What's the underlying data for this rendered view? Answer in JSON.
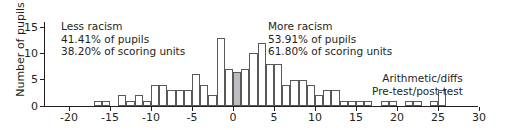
{
  "chart_data": {
    "type": "bar",
    "title": "",
    "subtitle": "",
    "xlabel": "",
    "ylabel": "Number of pupils",
    "xlim": [
      -21,
      31
    ],
    "ylim": [
      0,
      16
    ],
    "xticks": [
      -20,
      -15,
      -10,
      -5,
      0,
      5,
      10,
      15,
      20,
      25,
      30
    ],
    "yticks": [
      0,
      5,
      10,
      15
    ],
    "grid": false,
    "legend_position": "bottom-right",
    "bin_width": 1,
    "categories": [
      -18,
      -17,
      -16,
      -15,
      -14,
      -13,
      -12,
      -11,
      -10,
      -9,
      -8,
      -7,
      -6,
      -5,
      -4,
      -3,
      -2,
      -1,
      0,
      1,
      2,
      3,
      4,
      5,
      6,
      7,
      8,
      9,
      10,
      11,
      12,
      13,
      14,
      15,
      16,
      17,
      18,
      19,
      20,
      21,
      22,
      23,
      24,
      25
    ],
    "values": [
      0,
      1,
      1,
      0,
      2,
      1,
      2,
      1,
      4,
      4,
      3,
      3,
      3,
      6,
      4,
      2,
      13,
      7,
      6.5,
      7,
      10,
      12,
      8,
      8,
      4,
      5,
      5,
      4,
      2,
      3,
      3,
      1,
      1,
      1,
      1,
      0,
      1,
      1,
      0,
      1,
      1,
      0,
      1,
      3
    ],
    "highlighted_category": 0,
    "highlight_color": "#bcbdc0",
    "bar_edge_color": "#58595b",
    "bar_fill_color": "#ffffff",
    "axis_color": "#231f20",
    "annotations": {
      "left": {
        "heading": "Less racism",
        "line2": "41.41% of pupils",
        "line3": "38.20% of scoring units"
      },
      "right": {
        "heading": "More racism",
        "line2": "53.91% of pupils",
        "line3": "61.80% of scoring units"
      },
      "legend": {
        "line1": "Arithmetic/diffs",
        "line2": "Pre-test/post-test"
      }
    }
  }
}
